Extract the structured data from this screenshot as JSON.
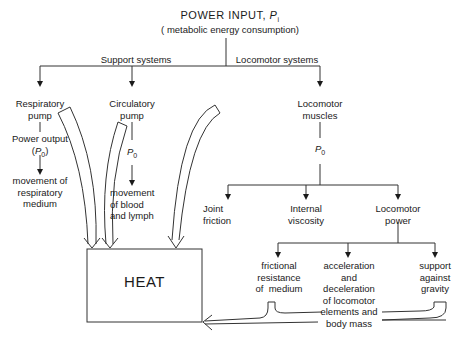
{
  "title": {
    "main": "POWER INPUT, ",
    "symbol": "P",
    "subscript": "i",
    "subtitle": "( metabolic energy consumption)"
  },
  "branches": {
    "support": "Support systems",
    "locomotor": "Locomotor systems"
  },
  "support_nodes": {
    "respiratory": {
      "label": "Respiratory\npump",
      "output_label": "Power output\n(",
      "output_symbol": "P",
      "output_sub": "0",
      "output_close": ")",
      "result": "movement of\nrespiratory\nmedium"
    },
    "circulatory": {
      "label": "Circulatory\npump",
      "output_symbol": "P",
      "output_sub": "0",
      "result": "movement\nof blood\nand lymph"
    }
  },
  "locomotor_nodes": {
    "muscles": {
      "label": "Locomotor\nmuscles",
      "output_symbol": "P",
      "output_sub": "0"
    },
    "children": [
      {
        "label": "Joint\nfriction"
      },
      {
        "label": "Internal\nviscosity"
      },
      {
        "label": "Locomotor\npower"
      }
    ],
    "power_children": [
      {
        "label": "frictional\nresistance\nof  medium"
      },
      {
        "label": "acceleration\nand\ndeceleration\nof locomotor\nelements and\nbody mass"
      },
      {
        "label": "support\nagainst\ngravity"
      }
    ]
  },
  "sink": {
    "label": "HEAT"
  }
}
